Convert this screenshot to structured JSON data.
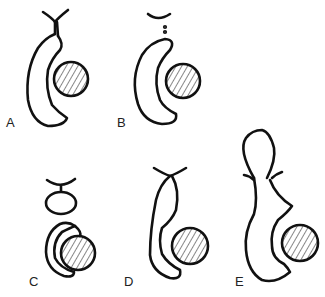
{
  "figure": {
    "panels": [
      {
        "label": "A",
        "x": 6,
        "y": 120
      },
      {
        "label": "B",
        "x": 117,
        "y": 120
      },
      {
        "label": "C",
        "x": 29,
        "y": 279
      },
      {
        "label": "D",
        "x": 124,
        "y": 279
      },
      {
        "label": "E",
        "x": 235,
        "y": 279
      }
    ]
  }
}
